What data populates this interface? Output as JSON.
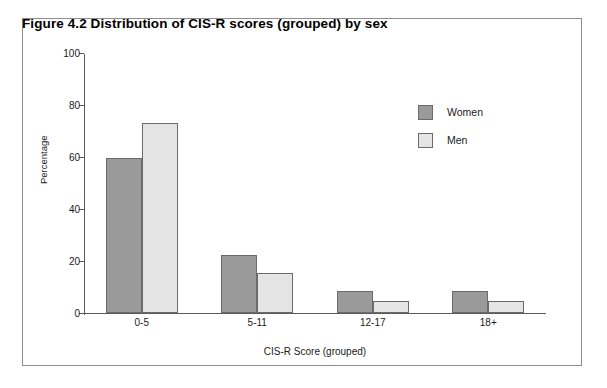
{
  "figure": {
    "title": "Figure 4.2  Distribution of CIS-R scores (grouped) by sex"
  },
  "chart_data": {
    "type": "bar",
    "title": "Figure 4.2  Distribution of CIS-R scores (grouped) by sex",
    "xlabel": "CIS-R Score (grouped)",
    "ylabel": "Percentage",
    "categories": [
      "0-5",
      "5-11",
      "12-17",
      "18+"
    ],
    "series": [
      {
        "name": "Women",
        "values": [
          59.5,
          22.5,
          8.5,
          8.5
        ],
        "color": "#9a9a9a"
      },
      {
        "name": "Men",
        "values": [
          73.0,
          15.5,
          4.5,
          4.5
        ],
        "color": "#e4e4e4"
      }
    ],
    "ylim": [
      0,
      100
    ],
    "yticks": [
      0,
      20,
      40,
      60,
      80,
      100
    ],
    "ytick_labels": [
      "0",
      "20",
      "40",
      "60",
      "80",
      "100"
    ],
    "grid": false,
    "legend_position": "upper right",
    "legend_entries": [
      "Women",
      "Men"
    ]
  }
}
